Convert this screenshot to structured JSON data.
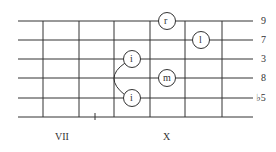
{
  "diagram": {
    "type": "guitar-fretboard-chord",
    "string_count": 6,
    "interval_labels": [
      "9",
      "7",
      "3",
      "8",
      "♭5"
    ],
    "fret_position_labels": [
      {
        "label": "VII",
        "x": 62
      },
      {
        "label": "X",
        "x": 167
      }
    ],
    "finger_dots": [
      {
        "finger": "r",
        "string_row": 0,
        "x": 167
      },
      {
        "finger": "l",
        "string_row": 1,
        "x": 201
      },
      {
        "finger": "i",
        "string_row": 2,
        "x": 132
      },
      {
        "finger": "m",
        "string_row": 3,
        "x": 167
      },
      {
        "finger": "i",
        "string_row": 4,
        "x": 132
      }
    ],
    "barre_arc": {
      "from_row": 2,
      "to_row": 4,
      "x": 132
    },
    "colors": {
      "line": "#333333",
      "background": "#ffffff"
    }
  }
}
